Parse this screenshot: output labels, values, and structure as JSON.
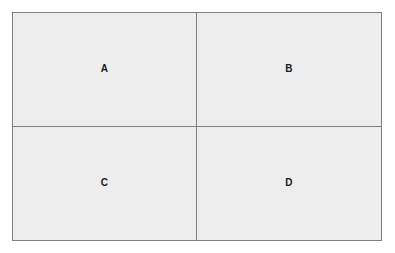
{
  "diagram": {
    "type": "quadrant-grid",
    "rows": 2,
    "columns": 2,
    "colors": {
      "page_background": "#ffffff",
      "cell_background": "#ededed",
      "border": "#808080",
      "label_text": "#1a1a1a"
    },
    "cells": [
      {
        "id": "a",
        "label": "A",
        "row": 1,
        "column": 1,
        "position": "top-left"
      },
      {
        "id": "b",
        "label": "B",
        "row": 1,
        "column": 2,
        "position": "top-right"
      },
      {
        "id": "c",
        "label": "C",
        "row": 2,
        "column": 1,
        "position": "bottom-left"
      },
      {
        "id": "d",
        "label": "D",
        "row": 2,
        "column": 2,
        "position": "bottom-right"
      }
    ]
  }
}
